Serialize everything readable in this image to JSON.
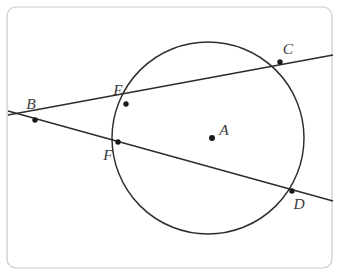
{
  "figure": {
    "kind": "geometry-diagram",
    "width": 339,
    "height": 275,
    "background_color": "#ffffff",
    "stroke_color": "#2c2c2c",
    "label_color": "#3a3a3a",
    "frame_color": "#c9c9c9"
  },
  "frame": {
    "x": 7,
    "y": 7,
    "width": 325,
    "height": 261,
    "corner_radius": 9
  },
  "circle": {
    "name": "circle-A",
    "center_label": "A",
    "cx": 208,
    "cy": 138,
    "r": 96
  },
  "points": [
    {
      "id": "A",
      "label": "A",
      "x": 212,
      "y": 138,
      "label_x": 224,
      "label_y": 131,
      "dot": true,
      "kind": "center"
    },
    {
      "id": "B",
      "label": "B",
      "x": 35,
      "y": 120,
      "label_x": 31,
      "label_y": 105,
      "dot": true,
      "kind": "external-intersection"
    },
    {
      "id": "C",
      "label": "C",
      "x": 280,
      "y": 62,
      "label_x": 288,
      "label_y": 50,
      "dot": true,
      "kind": "on-circle"
    },
    {
      "id": "D",
      "label": "D",
      "x": 292,
      "y": 191,
      "label_x": 299,
      "label_y": 205,
      "dot": true,
      "kind": "on-circle"
    },
    {
      "id": "E",
      "label": "E",
      "x": 126,
      "y": 104,
      "label_x": 118,
      "label_y": 91,
      "dot": true,
      "kind": "on-circle"
    },
    {
      "id": "F",
      "label": "F",
      "x": 118,
      "y": 142,
      "label_x": 108,
      "label_y": 156,
      "dot": true,
      "kind": "on-circle"
    }
  ],
  "lines": [
    {
      "id": "secant-BEC",
      "label": "B-E-C",
      "through": [
        "B",
        "E",
        "C"
      ],
      "x1": 8,
      "y1": 115,
      "x2": 333,
      "y2": 55
    },
    {
      "id": "secant-BFD",
      "label": "B-F-D",
      "through": [
        "B",
        "F",
        "D"
      ],
      "x1": 8,
      "y1": 111,
      "x2": 333,
      "y2": 201
    }
  ]
}
